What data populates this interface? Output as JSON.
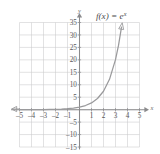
{
  "figure": {
    "title": "",
    "function_label": {
      "prefix": "f(x) = e",
      "exponent": "x",
      "full": "f(x) = e^x"
    },
    "axis_names": {
      "x": "x",
      "y": "y"
    },
    "colors": {
      "background": "#ffffff",
      "grid": "#c9c9cb",
      "axis": "#8a8a8c",
      "curve": "#9a9a9c",
      "text": "#58585a"
    }
  },
  "chart_data": {
    "type": "line",
    "title": "",
    "xlabel": "x",
    "ylabel": "y",
    "legend": [
      "f(x) = e^x"
    ],
    "annotations": [
      "f(x) = e^x"
    ],
    "grid": true,
    "legend_position": "top-right",
    "xlim": [
      -5,
      5
    ],
    "ylim": [
      -15,
      35
    ],
    "xticks": [
      -5,
      -4,
      -3,
      -2,
      -1,
      1,
      2,
      3,
      4,
      5
    ],
    "xtick_labels": [
      "-5",
      "-4",
      "-3",
      "-2",
      "-1",
      "1",
      "2",
      "3",
      "4",
      "5"
    ],
    "yticks": [
      -15,
      -10,
      -5,
      5,
      10,
      15,
      20,
      25,
      30,
      35
    ],
    "ytick_labels": [
      "-15",
      "-10",
      "-5",
      "5",
      "10",
      "15",
      "20",
      "25",
      "30",
      "35"
    ],
    "x_gridlines": [
      -5,
      -4,
      -3,
      -2,
      -1,
      0,
      1,
      2,
      3,
      4,
      5
    ],
    "y_gridlines": [
      -15,
      -10,
      -5,
      0,
      5,
      10,
      15,
      20,
      25,
      30,
      35
    ],
    "series": [
      {
        "name": "f(x) = e^x",
        "x": [
          -5,
          -4.5,
          -4,
          -3.5,
          -3,
          -2.5,
          -2,
          -1.5,
          -1,
          -0.5,
          0,
          0.5,
          1,
          1.5,
          2,
          2.5,
          3,
          3.25,
          3.5
        ],
        "values": [
          0.0067,
          0.0111,
          0.0183,
          0.0302,
          0.0498,
          0.0821,
          0.1353,
          0.2231,
          0.3679,
          0.6065,
          1.0,
          1.6487,
          2.7183,
          4.4817,
          7.3891,
          12.1825,
          20.0855,
          25.79,
          33.115
        ],
        "arrow_start": true,
        "arrow_end": true
      }
    ]
  }
}
